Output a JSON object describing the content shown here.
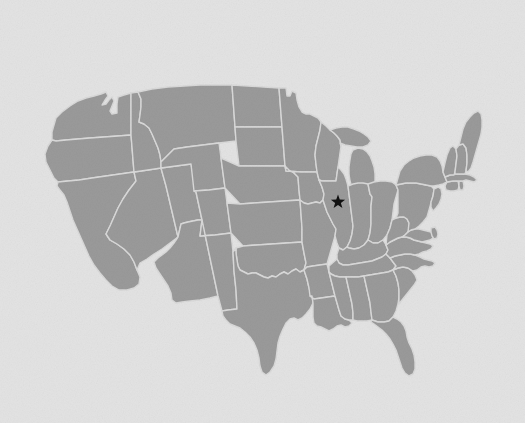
{
  "figure": {
    "kind": "map",
    "region": "Contiguous United States",
    "background_color": "#e3e3e3",
    "texture": "paper-grain",
    "has_labels": false,
    "has_legend": false,
    "has_axes": false,
    "has_border": false
  },
  "map": {
    "projection": "albers-usa-like",
    "land_fill": "#9a9a9a",
    "border_stroke": "#d9d9d9",
    "border_width": 1.4,
    "outline_stroke": "#d9d9d9",
    "water_fill": "#e3e3e3",
    "extent": {
      "left": 47,
      "top": 85,
      "right": 483,
      "bottom": 376
    },
    "subdivision_type": "states",
    "subdivision_count": 49
  },
  "markers": [
    {
      "name": "location-star",
      "glyph": "star",
      "points": 5,
      "color": "#111111",
      "size": 15,
      "x": 338,
      "y": 202,
      "placed_state": "Illinois",
      "placed_region": "northeastern Illinois (Chicago area)",
      "label": ""
    }
  ],
  "chart_data": {
    "type": "map",
    "xlabel": "",
    "ylabel": "",
    "values": [
      1
    ],
    "categories": [
      "Illinois"
    ],
    "annotations": [
      "black star marker in northeastern Illinois"
    ]
  }
}
